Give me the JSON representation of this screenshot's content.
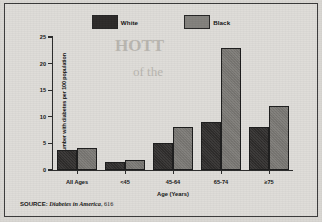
{
  "figure": {
    "background_color": "#d9d7d3",
    "frame_color": "#3a3a3a"
  },
  "legend": {
    "position": "top-center",
    "items": [
      {
        "label": "White",
        "color": "#2d2b2a",
        "swatch_name": "legend-swatch-white"
      },
      {
        "label": "Black",
        "color": "#83817d",
        "swatch_name": "legend-swatch-black"
      }
    ]
  },
  "source": {
    "keyword": "SOURCE:",
    "title": "Diabetes in America",
    "page": ", 616"
  },
  "ghost_text": {
    "line1": "HOTT",
    "line2": "of the"
  },
  "chart_data": {
    "type": "bar",
    "title": "",
    "subtitle": "",
    "xlabel": "Age (Years)",
    "ylabel": "Number with diabetes per 100 population",
    "categories": [
      "All Ages",
      "<45",
      "45-64",
      "65-74",
      "≥75"
    ],
    "series": [
      {
        "name": "White",
        "color": "#2d2b2a",
        "values": [
          3.7,
          1.6,
          5.1,
          9.0,
          8.0
        ]
      },
      {
        "name": "Black",
        "color": "#83817d",
        "values": [
          4.2,
          1.9,
          8.0,
          23.0,
          12.0
        ]
      }
    ],
    "ylim": [
      0,
      25
    ],
    "yticks": [
      0,
      5,
      10,
      15,
      20,
      25
    ],
    "ytick_labels": [
      "0",
      "5",
      "10",
      "15",
      "20",
      "25"
    ],
    "grid": false,
    "legend_position": "top-center"
  }
}
